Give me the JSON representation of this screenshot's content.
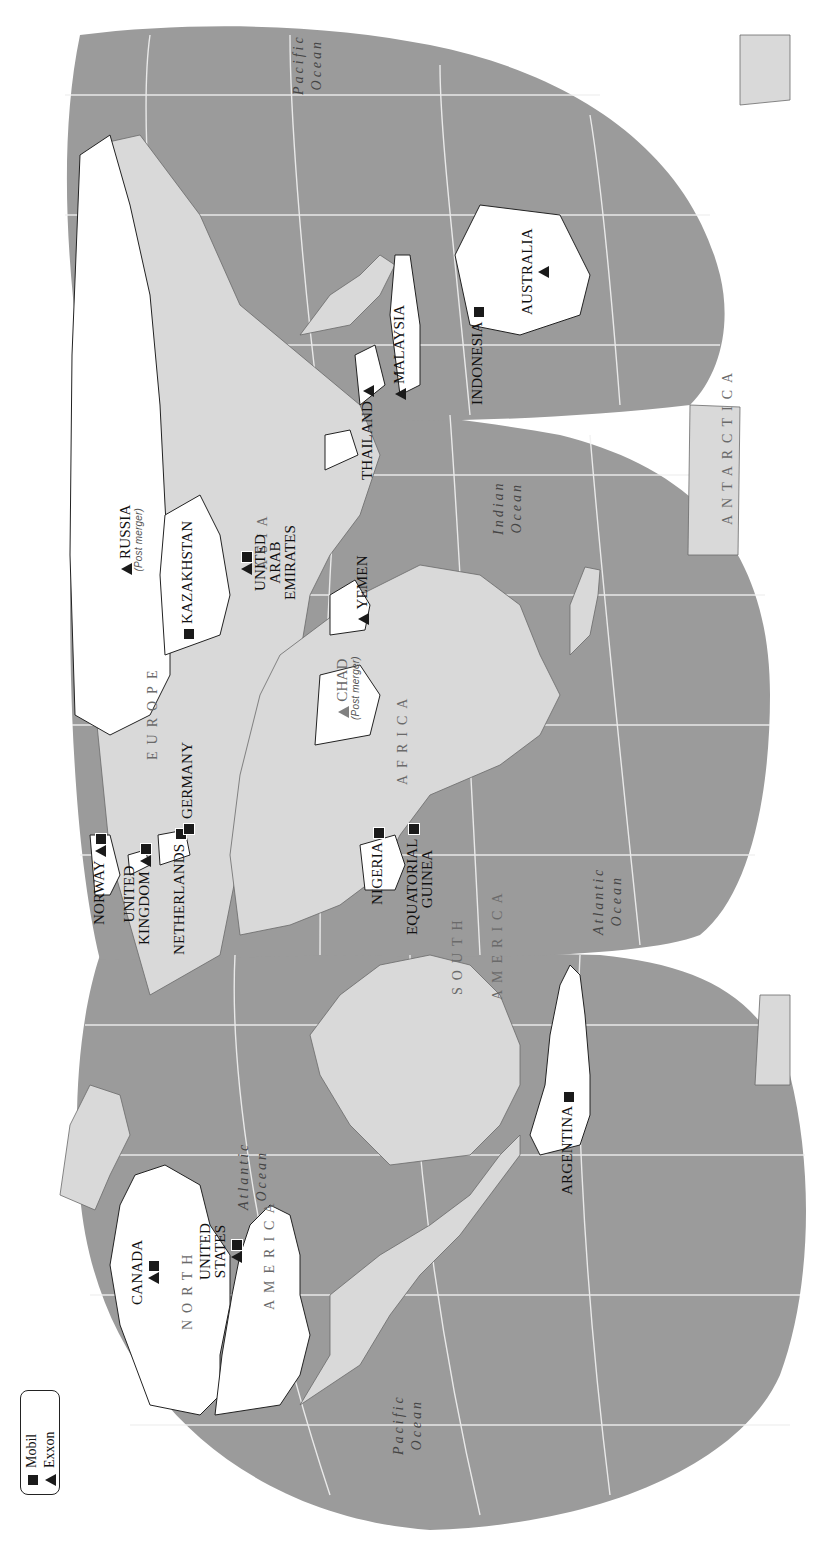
{
  "legend": {
    "items": [
      {
        "symbol": "square",
        "label": "Mobil"
      },
      {
        "symbol": "triangle",
        "label": "Exxon"
      }
    ]
  },
  "colors": {
    "ocean": "#9b9b9b",
    "land": "#d9d9d9",
    "highlight": "#ffffff",
    "graticule": "#f2f2f2",
    "marker": "#1a1a1a",
    "post_merger_marker": "#808080"
  },
  "continents": {
    "north_america_1": "NORTH",
    "north_america_2": "AMERICA",
    "south_america_1": "SOUTH",
    "south_america_2": "AMERICA",
    "europe": "EUROPE",
    "africa": "AFRICA",
    "asia": "ASIA",
    "antarctica": "ANTARCTICA"
  },
  "oceans": {
    "pacific_west": [
      "Pacific",
      "Ocean"
    ],
    "atlantic_north": [
      "Atlantic",
      "Ocean"
    ],
    "atlantic_south": [
      "Atlantic",
      "Ocean"
    ],
    "indian": [
      "Indian",
      "Ocean"
    ],
    "pacific_east": [
      "Pacific",
      "Ocean"
    ]
  },
  "countries": [
    {
      "name": "CANADA",
      "markers": [
        "triangle",
        "square"
      ]
    },
    {
      "name": "UNITED STATES",
      "line1": "UNITED",
      "line2": "STATES",
      "markers": [
        "triangle",
        "square"
      ]
    },
    {
      "name": "ARGENTINA",
      "markers": [
        "square"
      ]
    },
    {
      "name": "NORWAY",
      "markers": [
        "triangle",
        "square"
      ]
    },
    {
      "name": "UNITED KINGDOM",
      "line1": "UNITED",
      "line2": "KINGDOM",
      "markers": [
        "triangle",
        "square"
      ]
    },
    {
      "name": "NETHERLANDS",
      "markers": [
        "square"
      ]
    },
    {
      "name": "GERMANY",
      "markers": [
        "square"
      ]
    },
    {
      "name": "RUSSIA",
      "note": "(Post merger)",
      "markers": [
        "triangle"
      ]
    },
    {
      "name": "KAZAKHSTAN",
      "markers": [
        "square"
      ]
    },
    {
      "name": "UNITED ARAB EMIRATES",
      "line1": "UNITED",
      "line2": "ARAB",
      "line3": "EMIRATES",
      "markers": [
        "triangle",
        "square"
      ]
    },
    {
      "name": "YEMEN",
      "markers": [
        "triangle"
      ]
    },
    {
      "name": "CHAD",
      "note": "(Post merger)",
      "markers": [
        "triangle"
      ]
    },
    {
      "name": "NIGERIA",
      "markers": [
        "square"
      ]
    },
    {
      "name": "EQUATORIAL GUINEA",
      "line1": "EQUATORIAL",
      "line2": "GUINEA",
      "markers": [
        "square"
      ]
    },
    {
      "name": "THAILAND",
      "markers": [
        "triangle"
      ]
    },
    {
      "name": "MALAYSIA",
      "markers": [
        "triangle"
      ]
    },
    {
      "name": "INDONESIA",
      "markers": [
        "square"
      ]
    },
    {
      "name": "AUSTRALIA",
      "markers": [
        "triangle"
      ]
    }
  ]
}
